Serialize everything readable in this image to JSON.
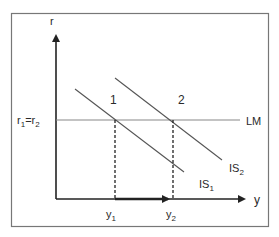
{
  "diagram": {
    "type": "IS-LM",
    "axes": {
      "y_label": "r",
      "x_label": "y"
    },
    "curves": {
      "lm": {
        "label": "LM"
      },
      "is1": {
        "label": "IS",
        "subscript": "1"
      },
      "is2": {
        "label": "IS",
        "subscript": "2"
      }
    },
    "equilibria": [
      {
        "label": "1",
        "x_label": "y",
        "x_subscript": "1"
      },
      {
        "label": "2",
        "x_label": "y",
        "x_subscript": "2"
      }
    ],
    "interest_rate_label": {
      "r1": "r",
      "r1_sub": "1",
      "eq": "=",
      "r2": "r",
      "r2_sub": "2"
    }
  },
  "colors": {
    "frame": "#777777",
    "axis": "#222222",
    "curve": "#555555",
    "lm": "#888888",
    "text": "#2a2a2a"
  }
}
